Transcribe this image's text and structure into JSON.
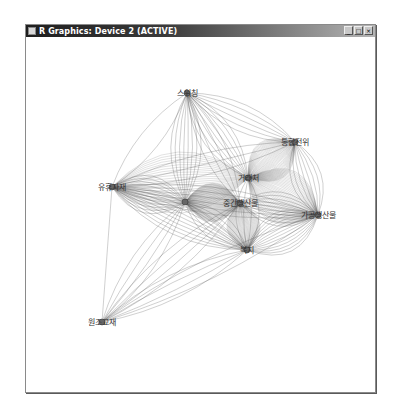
{
  "window": {
    "title": "R Graphics: Device 2 (ACTIVE)",
    "buttons": [
      {
        "name": "minimize",
        "glyph": "_"
      },
      {
        "name": "maximize",
        "glyph": "□"
      },
      {
        "name": "close",
        "glyph": "×"
      }
    ]
  },
  "graph": {
    "edge_color": "#555555",
    "node_color": "#666666",
    "nodes": [
      {
        "id": "switching",
        "label": "스위칭",
        "x": 187,
        "y": 93
      },
      {
        "id": "integration",
        "label": "통합전위",
        "x": 295,
        "y": 142
      },
      {
        "id": "idle_material",
        "label": "유휴자재",
        "x": 112,
        "y": 187
      },
      {
        "id": "center_left",
        "label": "",
        "x": 185,
        "y": 202
      },
      {
        "id": "client",
        "label": "거래처",
        "x": 248,
        "y": 178
      },
      {
        "id": "intermediate",
        "label": "중간생산물",
        "x": 240,
        "y": 203
      },
      {
        "id": "processed",
        "label": "가공생산물",
        "x": 318,
        "y": 215
      },
      {
        "id": "welfare",
        "label": "복지",
        "x": 247,
        "y": 250
      },
      {
        "id": "aid_material",
        "label": "원조교재",
        "x": 102,
        "y": 322
      }
    ],
    "edges": [
      {
        "from": "switching",
        "to": "integration",
        "count": 6
      },
      {
        "from": "switching",
        "to": "idle_material",
        "count": 2
      },
      {
        "from": "switching",
        "to": "center_left",
        "count": 8
      },
      {
        "from": "switching",
        "to": "client",
        "count": 8
      },
      {
        "from": "switching",
        "to": "intermediate",
        "count": 4
      },
      {
        "from": "integration",
        "to": "client",
        "count": 40
      },
      {
        "from": "integration",
        "to": "processed",
        "count": 8
      },
      {
        "from": "integration",
        "to": "idle_material",
        "count": 3
      },
      {
        "from": "idle_material",
        "to": "client",
        "count": 25
      },
      {
        "from": "idle_material",
        "to": "center_left",
        "count": 12
      },
      {
        "from": "idle_material",
        "to": "welfare",
        "count": 10
      },
      {
        "from": "idle_material",
        "to": "processed",
        "count": 6
      },
      {
        "from": "idle_material",
        "to": "aid_material",
        "count": 1
      },
      {
        "from": "center_left",
        "to": "intermediate",
        "count": 60
      },
      {
        "from": "center_left",
        "to": "welfare",
        "count": 6
      },
      {
        "from": "client",
        "to": "processed",
        "count": 40
      },
      {
        "from": "client",
        "to": "welfare",
        "count": 4
      },
      {
        "from": "intermediate",
        "to": "welfare",
        "count": 40
      },
      {
        "from": "intermediate",
        "to": "processed",
        "count": 10
      },
      {
        "from": "welfare",
        "to": "processed",
        "count": 14
      },
      {
        "from": "aid_material",
        "to": "center_left",
        "count": 4
      },
      {
        "from": "aid_material",
        "to": "welfare",
        "count": 4
      },
      {
        "from": "aid_material",
        "to": "intermediate",
        "count": 4
      },
      {
        "from": "aid_material",
        "to": "processed",
        "count": 2
      }
    ]
  }
}
